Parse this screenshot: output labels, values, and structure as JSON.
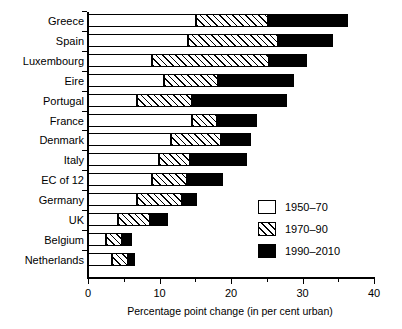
{
  "chart_data": {
    "type": "bar",
    "orientation": "horizontal",
    "stacked": true,
    "title": "",
    "xlabel": "Percentage point change (in per cent urban)",
    "ylabel": "",
    "xlim": [
      0,
      40
    ],
    "xticks": [
      0,
      10,
      20,
      30,
      40
    ],
    "xtick_labels": [
      "0",
      "10",
      "20",
      "30",
      "40"
    ],
    "grid": false,
    "legend_position": "center-right",
    "categories": [
      "Greece",
      "Spain",
      "Luxembourg",
      "Eire",
      "Portugal",
      "France",
      "Denmark",
      "Italy",
      "EC of 12",
      "Germany",
      "UK",
      "Belgium",
      "Netherlands"
    ],
    "series": [
      {
        "name": "1950-70",
        "fill": "white",
        "values": [
          15.1,
          14.0,
          8.9,
          10.6,
          6.9,
          14.5,
          11.6,
          9.9,
          8.9,
          6.9,
          4.2,
          2.5,
          3.4
        ]
      },
      {
        "name": "1970-90",
        "fill": "hatched",
        "values": [
          10.1,
          12.6,
          16.4,
          7.6,
          7.6,
          3.6,
          7.0,
          4.3,
          5.0,
          6.2,
          4.5,
          2.2,
          2.2
        ]
      },
      {
        "name": "1990-2010",
        "fill": "black",
        "values": [
          11.2,
          7.6,
          5.3,
          10.6,
          13.4,
          5.6,
          4.2,
          8.1,
          5.0,
          2.2,
          2.5,
          1.5,
          1.0
        ]
      }
    ],
    "totals": [
      36.4,
      34.2,
      30.6,
      28.8,
      27.9,
      23.7,
      22.8,
      22.3,
      18.9,
      15.3,
      11.2,
      6.2,
      6.6
    ]
  },
  "legend": {
    "items": [
      {
        "label": "1950–70",
        "fill": "white"
      },
      {
        "label": "1970–90",
        "fill": "hatched"
      },
      {
        "label": "1990–2010",
        "fill": "black"
      }
    ]
  },
  "colors": {
    "ink": "#000000",
    "paper": "#ffffff"
  }
}
